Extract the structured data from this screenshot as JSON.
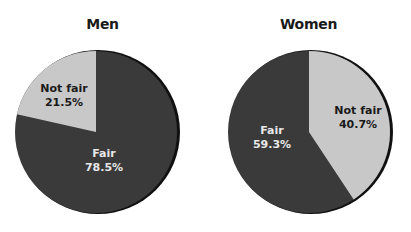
{
  "chart_data": [
    {
      "type": "pie",
      "title": "Men",
      "categories": [
        "Fair",
        "Not fair"
      ],
      "values": [
        78.5,
        21.5
      ],
      "labels": [
        "Fair\n78.5%",
        "Not fair\n21.5%"
      ],
      "colors": [
        "#3a3a3a",
        "#c8c8c8"
      ],
      "start_angle": "12 o'clock",
      "legend": "none (inline labels)"
    },
    {
      "type": "pie",
      "title": "Women",
      "categories": [
        "Fair",
        "Not fair"
      ],
      "values": [
        59.3,
        40.7
      ],
      "labels": [
        "Fair\n59.3%",
        "Not fair\n40.7%"
      ],
      "colors": [
        "#3a3a3a",
        "#c8c8c8"
      ],
      "start_angle": "12 o'clock",
      "legend": "none (inline labels)"
    }
  ],
  "charts": [
    {
      "title": "Men",
      "fair": {
        "label": "Fair",
        "pct": "78.5%"
      },
      "not_fair": {
        "label": "Not fair",
        "pct": "21.5%"
      }
    },
    {
      "title": "Women",
      "fair": {
        "label": "Fair",
        "pct": "59.3%"
      },
      "not_fair": {
        "label": "Not fair",
        "pct": "40.7%"
      }
    }
  ],
  "colors": {
    "dark_slice": "#3a3a3a",
    "light_slice": "#c8c8c8",
    "rim": "#111111"
  }
}
